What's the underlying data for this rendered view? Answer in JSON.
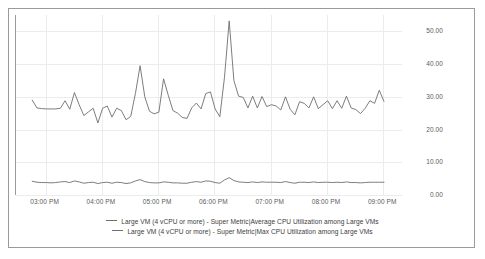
{
  "chart_data": {
    "type": "line",
    "title": "",
    "xlabel": "",
    "ylabel": "",
    "ylim": [
      0,
      55
    ],
    "yticks": [
      0,
      10,
      20,
      30,
      40,
      50
    ],
    "ytick_labels": [
      "0.00",
      "10.00",
      "20.00",
      "30.00",
      "40.00",
      "50.00"
    ],
    "grid": true,
    "legend_position": "bottom",
    "x_axis_type": "time",
    "x_range": [
      "02:50 PM",
      "09:10 PM"
    ],
    "xticks": [
      "03:00 PM",
      "04:00 PM",
      "05:00 PM",
      "06:00 PM",
      "07:00 PM",
      "08:00 PM",
      "09:00 PM"
    ],
    "xtick_labels": [
      "03:00 PM",
      "04:00 PM",
      "05:00 PM",
      "06:00 PM",
      "07:00 PM",
      "08:00 PM",
      "09:00 PM"
    ],
    "series": [
      {
        "name": "Large VM (4 vCPU or more) - Super Metric|Average CPU Utilization among Large VMs",
        "color": "#6e6e6e",
        "x": [
          0,
          1.3,
          2.6,
          3.9,
          5.2,
          6.5,
          7.8,
          9.1,
          10.4,
          11.7,
          13.0,
          14.3,
          15.6,
          16.9,
          18.2,
          19.5,
          20.8,
          22.1,
          23.4,
          24.7,
          26.0,
          27.3,
          28.6,
          29.9,
          31.2,
          32.5,
          33.8,
          35.1,
          36.4,
          37.7,
          39.0,
          40.3,
          41.6,
          42.9,
          44.2,
          45.5,
          46.8,
          48.1,
          49.4,
          50.7,
          52.0,
          53.3,
          54.6,
          55.9,
          57.2,
          58.5,
          59.8,
          61.1,
          62.4,
          63.7,
          65.0,
          66.3,
          67.6,
          68.9,
          70.2,
          71.5,
          72.8,
          74.1,
          75.4,
          76.7,
          78.0,
          79.3,
          80.6,
          81.9,
          83.2,
          84.5,
          85.8,
          87.1,
          88.4,
          89.7,
          91.0,
          92.3,
          93.6,
          94.9,
          96.2,
          97.5
        ],
        "values": [
          29.0,
          26.6,
          26.4,
          26.3,
          26.3,
          26.3,
          26.5,
          28.8,
          26.2,
          31.3,
          27.6,
          24.3,
          25.4,
          26.5,
          22.0,
          26.5,
          27.2,
          23.8,
          26.5,
          25.8,
          23.0,
          24.0,
          31.0,
          39.5,
          30.0,
          25.6,
          24.8,
          25.3,
          35.5,
          30.5,
          25.8,
          25.0,
          23.7,
          23.4,
          26.6,
          28.1,
          26.3,
          31.0,
          31.5,
          26.3,
          23.9,
          36.0,
          53.2,
          35.0,
          30.2,
          29.8,
          26.6,
          30.2,
          26.6,
          30.1,
          27.0,
          27.6,
          27.2,
          26.0,
          30.0,
          26.2,
          24.5,
          28.5,
          28.0,
          26.6,
          30.0,
          26.4,
          27.6,
          28.8,
          26.4,
          28.8,
          26.5,
          30.2,
          26.6,
          26.1,
          24.9,
          26.5,
          28.8,
          28.0,
          32.0,
          28.6
        ]
      },
      {
        "name": "Large VM (4 vCPU or more) - Super Metric|Max CPU Utilization among Large VMs",
        "color": "#6e6e6e",
        "x": [
          0,
          1.3,
          2.6,
          3.9,
          5.2,
          6.5,
          7.8,
          9.1,
          10.4,
          11.7,
          13.0,
          14.3,
          15.6,
          16.9,
          18.2,
          19.5,
          20.8,
          22.1,
          23.4,
          24.7,
          26.0,
          27.3,
          28.6,
          29.9,
          31.2,
          32.5,
          33.8,
          35.1,
          36.4,
          37.7,
          39.0,
          40.3,
          41.6,
          42.9,
          44.2,
          45.5,
          46.8,
          48.1,
          49.4,
          50.7,
          52.0,
          53.3,
          54.6,
          55.9,
          57.2,
          58.5,
          59.8,
          61.1,
          62.4,
          63.7,
          65.0,
          66.3,
          67.6,
          68.9,
          70.2,
          71.5,
          72.8,
          74.1,
          75.4,
          76.7,
          78.0,
          79.3,
          80.6,
          81.9,
          83.2,
          84.5,
          85.8,
          87.1,
          88.4,
          89.7,
          91.0,
          92.3,
          93.6,
          94.9,
          96.2,
          97.5
        ],
        "values": [
          4.2,
          3.9,
          3.8,
          3.8,
          3.7,
          3.8,
          4.0,
          4.1,
          3.8,
          4.3,
          4.0,
          3.6,
          3.8,
          3.9,
          3.5,
          3.8,
          3.9,
          3.6,
          3.9,
          3.8,
          3.5,
          3.7,
          4.3,
          4.7,
          4.1,
          3.8,
          3.7,
          3.7,
          4.0,
          3.9,
          3.7,
          3.7,
          3.6,
          3.6,
          3.9,
          4.1,
          3.9,
          4.3,
          4.2,
          3.8,
          3.6,
          4.6,
          5.3,
          4.4,
          4.0,
          3.9,
          3.8,
          4.0,
          3.8,
          4.0,
          3.9,
          3.9,
          3.9,
          3.8,
          4.1,
          3.8,
          3.6,
          3.9,
          3.9,
          3.8,
          4.0,
          3.8,
          3.9,
          3.9,
          3.8,
          3.9,
          3.8,
          4.0,
          3.8,
          3.8,
          3.7,
          3.8,
          3.9,
          3.9,
          3.9,
          3.9
        ]
      }
    ]
  },
  "axis": {
    "y_tick_labels": [
      "50.00",
      "40.00",
      "30.00",
      "20.00",
      "10.00",
      "0.00"
    ],
    "x_tick_labels": [
      "03:00 PM",
      "04:00 PM",
      "05:00 PM",
      "06:00 PM",
      "07:00 PM",
      "08:00 PM",
      "09:00 PM"
    ]
  },
  "legend": {
    "entries": [
      {
        "label": "Large VM (4 vCPU or more) - Super Metric|Average CPU Utilization among Large VMs",
        "color": "#6e6e6e"
      },
      {
        "label": "Large VM (4 vCPU or more) - Super Metric|Max CPU Utilization among Large VMs",
        "color": "#6e6e6e"
      }
    ]
  },
  "colors": {
    "series_line": "#6e6e6e",
    "gridline": "#ececec",
    "axis": "#9a9a9a",
    "tick_text": "#5b5b5b",
    "legend_text": "#3d3d3d",
    "frame": "#9a9a9a",
    "background": "#ffffff"
  }
}
